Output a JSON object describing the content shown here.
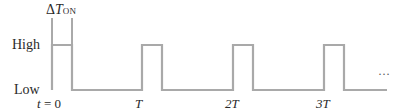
{
  "diagram": {
    "type": "pulse-train timing diagram",
    "levels": {
      "high": "High",
      "low": "Low"
    },
    "pulse_width_label": {
      "delta": "Δ",
      "symbol": "T",
      "subscript": "ON"
    },
    "time_labels": [
      {
        "text": "t = 0",
        "italic_part": "t",
        "rest": " = 0"
      },
      {
        "text": "T"
      },
      {
        "text": "2T"
      },
      {
        "text": "3T"
      }
    ],
    "continuation": "…",
    "colors": {
      "waveform": "#a9a9a9",
      "marker": "#555555",
      "text": "#2a2a2a"
    },
    "pulses": [
      {
        "start_x": 52,
        "end_x": 72
      },
      {
        "start_x": 142,
        "end_x": 162
      },
      {
        "start_x": 233,
        "end_x": 253
      },
      {
        "start_x": 324,
        "end_x": 344
      }
    ]
  }
}
